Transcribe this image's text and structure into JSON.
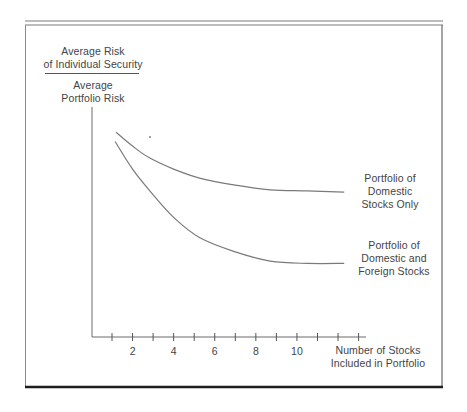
{
  "chart_data": {
    "type": "line",
    "title": "",
    "ylabel": {
      "numerator": [
        "Average Risk",
        "of Individual Security"
      ],
      "denominator": [
        "Average",
        "Portfolio Risk"
      ]
    },
    "xlabel": [
      "Number of Stocks",
      "Included in Portfolio"
    ],
    "x_ticks": [
      1,
      2,
      3,
      4,
      5,
      6,
      7,
      8,
      9,
      10,
      11,
      12,
      13
    ],
    "x_tick_labels": [
      "2",
      "4",
      "6",
      "8",
      "10"
    ],
    "x_tick_label_values": [
      2,
      4,
      6,
      8,
      10
    ],
    "xlim": [
      0,
      13.5
    ],
    "ylim": [
      0,
      1
    ],
    "y_ticks": [],
    "grid": false,
    "legend": "inline labels at right end of each curve",
    "series": [
      {
        "name": "Portfolio of Domestic Stocks Only",
        "label_lines": [
          "Portfolio of",
          "Domestic",
          "Stocks Only"
        ],
        "x": [
          1.2,
          2.0,
          2.8,
          4.0,
          5.3,
          7.0,
          8.7,
          10.5,
          12.3
        ],
        "y": [
          0.89,
          0.83,
          0.78,
          0.73,
          0.69,
          0.66,
          0.64,
          0.635,
          0.63
        ]
      },
      {
        "name": "Portfolio of Domestic and Foreign Stocks",
        "label_lines": [
          "Portfolio of",
          "Domestic and",
          "Foreign Stocks"
        ],
        "x": [
          1.15,
          2.0,
          2.8,
          4.0,
          5.3,
          7.0,
          8.7,
          10.5,
          12.3
        ],
        "y": [
          0.85,
          0.73,
          0.64,
          0.52,
          0.43,
          0.37,
          0.33,
          0.32,
          0.32
        ]
      }
    ]
  },
  "colors": {
    "curve": "#7a7a7a",
    "axis": "#555555",
    "frame": "#6a6a6a",
    "bottom_rule": "#1e1e1e",
    "text": "#444444"
  }
}
